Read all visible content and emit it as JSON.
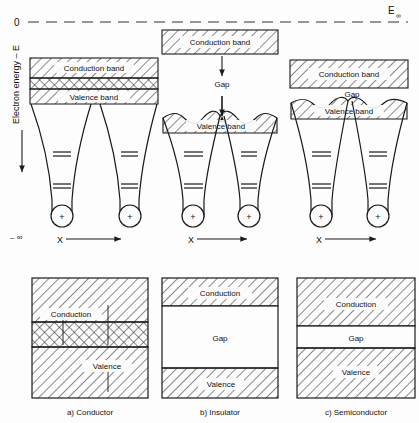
{
  "figure": {
    "title_implicit": "Energy band formation in conductor, insulator and semiconductor",
    "axes": {
      "y_label": "Electron energy – E",
      "y_zero_label": "0",
      "y_top_right_label": "E",
      "y_top_right_sub": "∞",
      "y_bottom_label": "– ∞",
      "x_label": "X"
    },
    "colors": {
      "ink": "#1a1a1a",
      "background": "#fdfdfd",
      "hatch": "#333333"
    }
  },
  "top_panels": [
    {
      "id": "conductor",
      "x_label": "X",
      "bands": [
        {
          "name": "conduction",
          "label": "Conduction band",
          "fill": "diagonal"
        },
        {
          "name": "overlap",
          "label": "",
          "fill": "cross"
        },
        {
          "name": "valence",
          "label": "Valence band",
          "fill": "diagonal"
        }
      ],
      "gap_label": "",
      "wells": 2,
      "nucleus_symbol": "+"
    },
    {
      "id": "insulator",
      "x_label": "X",
      "bands": [
        {
          "name": "conduction",
          "label": "Conduction band",
          "fill": "diagonal"
        },
        {
          "name": "valence",
          "label": "Valence band",
          "fill": "diagonal"
        }
      ],
      "gap_label": "Gap",
      "wells": 2,
      "nucleus_symbol": "+"
    },
    {
      "id": "semiconductor",
      "x_label": "X",
      "bands": [
        {
          "name": "conduction",
          "label": "Conduction band",
          "fill": "diagonal"
        },
        {
          "name": "valence",
          "label": "Valence band",
          "fill": "diagonal"
        }
      ],
      "gap_label": "Gap",
      "wells": 2,
      "nucleus_symbol": "+"
    }
  ],
  "bottom_panels": [
    {
      "id": "conductor",
      "caption": "a) Conductor",
      "regions": [
        {
          "name": "conduction",
          "label": "Conduction",
          "fill": "diagonal"
        },
        {
          "name": "overlap",
          "label": "",
          "fill": "cross"
        },
        {
          "name": "valence",
          "label": "Valence",
          "fill": "diagonal"
        }
      ]
    },
    {
      "id": "insulator",
      "caption": "b) Insulator",
      "regions": [
        {
          "name": "conduction",
          "label": "Conduction",
          "fill": "diagonal"
        },
        {
          "name": "gap",
          "label": "Gap",
          "fill": "none"
        },
        {
          "name": "valence",
          "label": "Valence",
          "fill": "diagonal"
        }
      ]
    },
    {
      "id": "semiconductor",
      "caption": "c) Semiconductor",
      "regions": [
        {
          "name": "conduction",
          "label": "Conduction",
          "fill": "diagonal"
        },
        {
          "name": "gap",
          "label": "Gap",
          "fill": "none"
        },
        {
          "name": "valence",
          "label": "Valence",
          "fill": "diagonal"
        }
      ]
    }
  ]
}
